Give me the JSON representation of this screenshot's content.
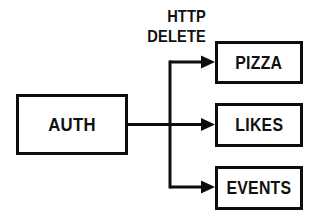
{
  "diagram": {
    "type": "flow-diagram",
    "background_color": "#ffffff",
    "stroke_color": "#0d0d0d",
    "canvas": {
      "width": 318,
      "height": 224
    },
    "edge_label": {
      "line1": "HTTP",
      "line2": "DELETE"
    },
    "source_node": {
      "id": "auth",
      "label": "AUTH",
      "x": 16,
      "y": 94,
      "width": 112,
      "height": 61
    },
    "target_nodes": [
      {
        "id": "pizza",
        "label": "PIZZA",
        "x": 215,
        "y": 41,
        "width": 88,
        "height": 43
      },
      {
        "id": "likes",
        "label": "LIKES",
        "x": 215,
        "y": 103,
        "width": 88,
        "height": 44
      },
      {
        "id": "events",
        "label": "EVENTS",
        "x": 215,
        "y": 166,
        "width": 88,
        "height": 44
      }
    ],
    "connectors": {
      "trunk_x": 170,
      "trunk_top_y": 62,
      "trunk_bottom_y": 187,
      "source_exit_y": 124,
      "branch_ys": [
        62,
        124,
        187
      ],
      "arrow_tip_x": 215,
      "line_width": 3,
      "arrowhead": "solid-triangle"
    }
  }
}
